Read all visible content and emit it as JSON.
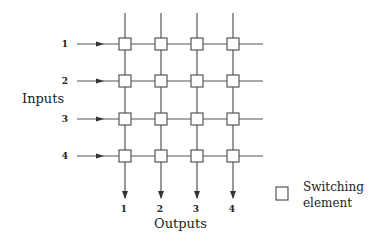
{
  "diagram": {
    "inputs_label": "Inputs",
    "outputs_label": "Outputs",
    "input_numbers": [
      "1",
      "2",
      "3",
      "4"
    ],
    "output_numbers": [
      "1",
      "2",
      "3",
      "4"
    ],
    "legend": {
      "line1": "Switching",
      "line2": "element"
    },
    "grid": {
      "columns_x": [
        125,
        161,
        197,
        233
      ],
      "rows_y": [
        44,
        81,
        119,
        156
      ],
      "line_color": "#555555"
    }
  }
}
